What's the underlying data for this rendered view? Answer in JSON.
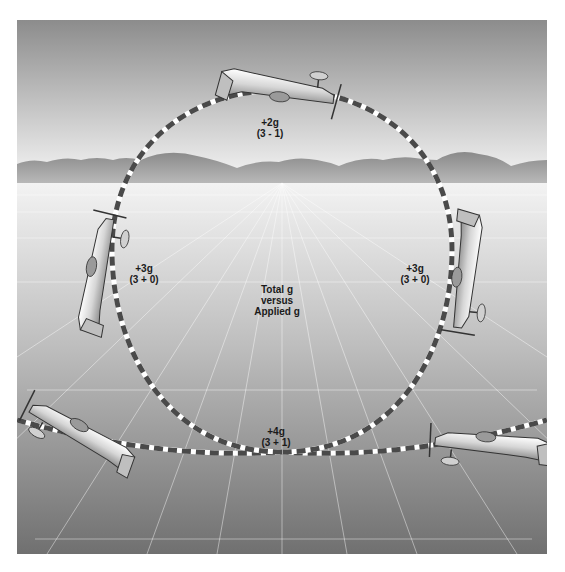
{
  "figure": {
    "title_center": [
      "Total g",
      "versus",
      "Applied g"
    ],
    "positions": [
      {
        "id": "top",
        "total": "+2g",
        "formula": "(3 - 1)"
      },
      {
        "id": "left",
        "total": "+3g",
        "formula": "(3 + 0)"
      },
      {
        "id": "right",
        "total": "+3g",
        "formula": "(3 + 0)"
      },
      {
        "id": "bottom",
        "total": "+4g",
        "formula": "(3 + 1)"
      }
    ],
    "colors": {
      "sky_top": "#8c8c8c",
      "sky_horizon": "#f2f2f2",
      "mountains": "#9a9a9a",
      "ground_near": "#e8e8e8",
      "ground_far": "#7a7a7a",
      "path_dash": "#4a4a4a",
      "path_gap": "#ffffff"
    }
  }
}
